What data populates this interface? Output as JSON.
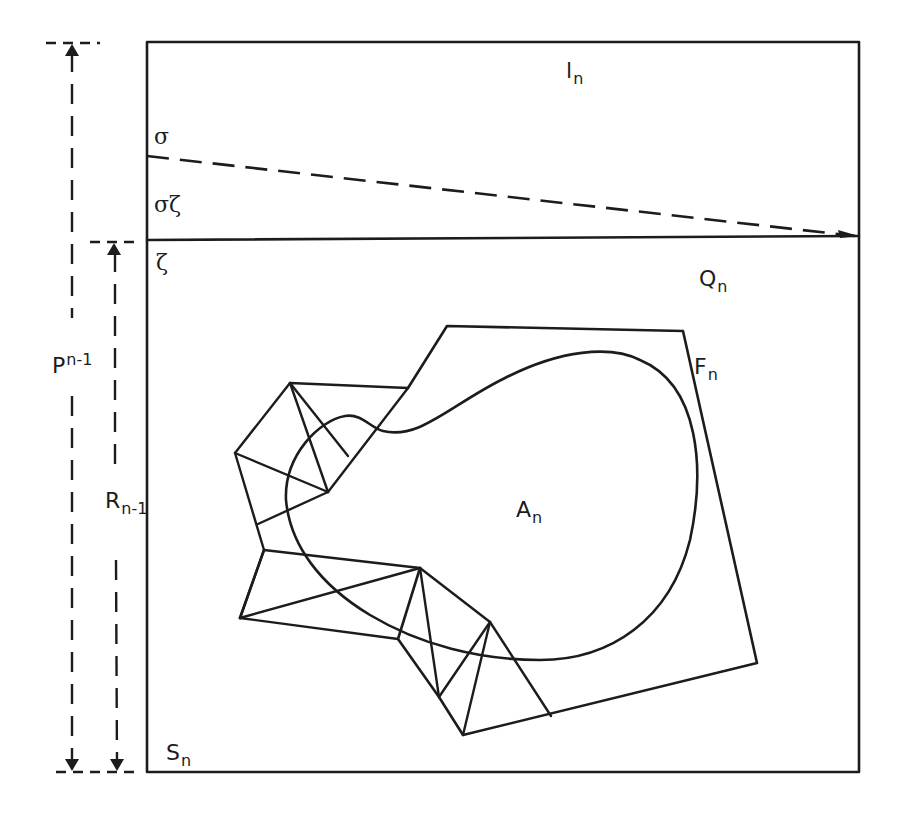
{
  "diagram": {
    "colors": {
      "ink": "#1c1c1c",
      "background": "#ffffff"
    },
    "labels": {
      "l_n": {
        "base": "l",
        "sub": "n"
      },
      "sigma": {
        "text": "σ"
      },
      "sigma_zeta": {
        "text": "σζ"
      },
      "zeta": {
        "text": "ζ"
      },
      "Q_n": {
        "base": "Q",
        "sub": "n"
      },
      "F_n": {
        "base": "F",
        "sub": "n"
      },
      "A_n": {
        "base": "A",
        "sub": "n"
      },
      "S_n": {
        "base": "S",
        "sub": "n"
      },
      "P_n_minus_1": {
        "base": "P",
        "sup": "n-1"
      },
      "R_n_minus_1": {
        "base": "R",
        "sub": "n-1"
      }
    },
    "regions": [
      {
        "id": "l_n",
        "description": "upper strip of outer square above horizontal divider"
      },
      {
        "id": "Q_n",
        "description": "lower part of outer square below horizontal divider"
      },
      {
        "id": "F_n",
        "description": "polygonal region containing A_n"
      },
      {
        "id": "A_n",
        "description": "curved closed region"
      },
      {
        "id": "S_n",
        "description": "outer square"
      }
    ],
    "dimensions": [
      {
        "id": "P_n_minus_1",
        "spans": "full height of outer square"
      },
      {
        "id": "R_n_minus_1",
        "spans": "height from divider line to bottom"
      }
    ]
  }
}
